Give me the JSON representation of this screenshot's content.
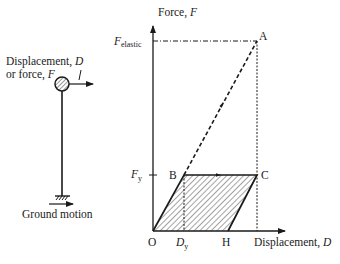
{
  "structure": {
    "input_label_line1": "Displacement, ",
    "input_label_line1_var": "D",
    "input_label_line2": "or force, ",
    "input_label_line2_var": "F",
    "ground_label": "Ground motion"
  },
  "plot": {
    "y_axis_label": "Force, ",
    "y_axis_var": "F",
    "x_axis_label": "Displacement, ",
    "x_axis_var": "D",
    "f_elastic_main": "F",
    "f_elastic_sub": "elastic",
    "f_y_main": "F",
    "f_y_sub": "y",
    "d_y_main": "D",
    "d_y_sub": "y",
    "points": {
      "O": "O",
      "A": "A",
      "B": "B",
      "C": "C",
      "H": "H"
    }
  },
  "colors": {
    "ink": "#1a1a1a",
    "background": "#ffffff"
  }
}
